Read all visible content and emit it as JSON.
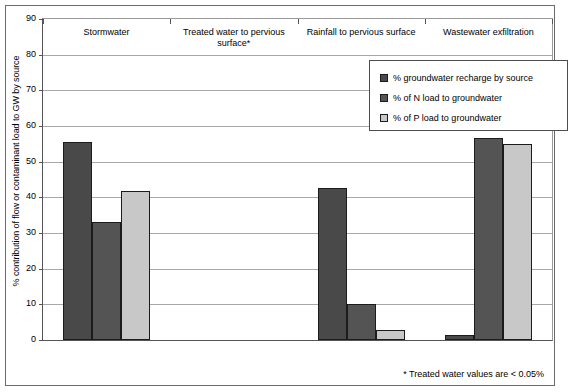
{
  "chart_data": {
    "type": "bar",
    "title": "",
    "xlabel": "",
    "ylabel": "% contribution of flow or contaminant load to GW by source",
    "ylim": [
      0,
      90
    ],
    "ytick_step": 10,
    "yticks": [
      90,
      80,
      70,
      60,
      50,
      40,
      30,
      20,
      10,
      0
    ],
    "grid": true,
    "legend_position": "inside-top-right",
    "categories": [
      "Stormwater",
      "Treated water to pervious surface*",
      "Rainfall to pervious surface",
      "Wastewater exfiltration"
    ],
    "series": [
      {
        "name": "% groundwater recharge by source",
        "color": "#494949",
        "values": [
          55.5,
          0.02,
          42.5,
          1.5
        ]
      },
      {
        "name": "% of N load to groundwater",
        "color": "#545454",
        "values": [
          33.0,
          0.02,
          10.0,
          56.5
        ]
      },
      {
        "name": "% of P load to groundwater",
        "color": "#c8c8c8",
        "values": [
          41.8,
          0.02,
          2.7,
          55.0
        ]
      }
    ],
    "annotations": [
      "* Treated water values are < 0.05%"
    ]
  },
  "footnote": "* Treated water values are < 0.05%"
}
